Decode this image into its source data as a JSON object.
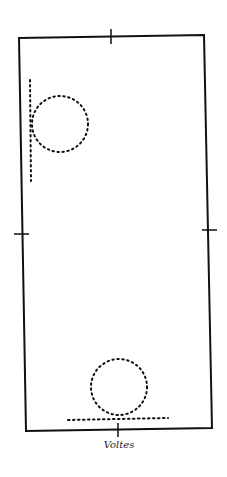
{
  "diagram": {
    "label": "Voltes",
    "figures": [
      {
        "name": "volte-on-long-side",
        "shape": "circle",
        "style": "dotted",
        "track": "vertical-dotted-line"
      },
      {
        "name": "volte-on-short-side",
        "shape": "circle",
        "style": "dotted",
        "track": "horizontal-dotted-line"
      }
    ],
    "markers": [
      "top-center",
      "left-middle",
      "right-middle",
      "bottom-center"
    ],
    "colors": {
      "ink": "#111111",
      "background": "#ffffff"
    }
  }
}
